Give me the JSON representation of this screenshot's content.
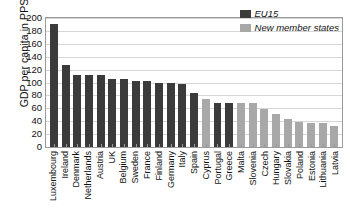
{
  "chart_data": {
    "type": "bar",
    "title": "",
    "subtitle": "",
    "xlabel": "",
    "ylabel": "GDP per capita in PPS",
    "ylim": [
      0,
      200
    ],
    "yticks": [
      0,
      20,
      40,
      60,
      80,
      100,
      120,
      140,
      160,
      180,
      200
    ],
    "grid": true,
    "legend_position": "top-right",
    "categories": [
      "Luxembourg",
      "Ireland",
      "Denmark",
      "Netherlands",
      "Austria",
      "UK",
      "Belgium",
      "Sweden",
      "France",
      "Finland",
      "Germany",
      "Italy",
      "Spain",
      "Cyprus",
      "Portugal",
      "Greece",
      "Malta",
      "Slovenia",
      "Czech",
      "Hungary",
      "Slovakia",
      "Poland",
      "Estonia",
      "Lithuania",
      "Latvia"
    ],
    "values": [
      190,
      127,
      112,
      111,
      111,
      106,
      105,
      102,
      102,
      100,
      99,
      97,
      84,
      75,
      69,
      69,
      68,
      68,
      59,
      51,
      44,
      39,
      38,
      38,
      33
    ],
    "groups": [
      "EU15",
      "EU15",
      "EU15",
      "EU15",
      "EU15",
      "EU15",
      "EU15",
      "EU15",
      "EU15",
      "EU15",
      "EU15",
      "EU15",
      "EU15",
      "New member states",
      "EU15",
      "EU15",
      "New member states",
      "New member states",
      "New member states",
      "New member states",
      "New member states",
      "New member states",
      "New member states",
      "New member states",
      "New member states"
    ],
    "series": [
      {
        "name": "EU15",
        "color": "#3b3b3b",
        "points": [
          {
            "category": "Luxembourg",
            "value": 190
          },
          {
            "category": "Ireland",
            "value": 127
          },
          {
            "category": "Denmark",
            "value": 112
          },
          {
            "category": "Netherlands",
            "value": 111
          },
          {
            "category": "Austria",
            "value": 111
          },
          {
            "category": "UK",
            "value": 106
          },
          {
            "category": "Belgium",
            "value": 105
          },
          {
            "category": "Sweden",
            "value": 102
          },
          {
            "category": "France",
            "value": 102
          },
          {
            "category": "Finland",
            "value": 100
          },
          {
            "category": "Germany",
            "value": 99
          },
          {
            "category": "Italy",
            "value": 97
          },
          {
            "category": "Spain",
            "value": 84
          },
          {
            "category": "Portugal",
            "value": 69
          },
          {
            "category": "Greece",
            "value": 69
          }
        ]
      },
      {
        "name": "New member states",
        "color": "#a8a8a8",
        "points": [
          {
            "category": "Cyprus",
            "value": 75
          },
          {
            "category": "Malta",
            "value": 68
          },
          {
            "category": "Slovenia",
            "value": 68
          },
          {
            "category": "Czech",
            "value": 59
          },
          {
            "category": "Hungary",
            "value": 51
          },
          {
            "category": "Slovakia",
            "value": 44
          },
          {
            "category": "Poland",
            "value": 39
          },
          {
            "category": "Estonia",
            "value": 38
          },
          {
            "category": "Lithuania",
            "value": 38
          },
          {
            "category": "Latvia",
            "value": 33
          }
        ]
      }
    ]
  },
  "legend": {
    "items": [
      {
        "label": "EU15",
        "color": "#3b3b3b"
      },
      {
        "label": "New member states",
        "color": "#a8a8a8"
      }
    ]
  },
  "colors": {
    "eu15": "#3b3b3b",
    "new_member_states": "#a8a8a8",
    "gridline": "#d6d6d6",
    "axis": "#9a9a9a",
    "text": "#111111",
    "background": "#ffffff"
  }
}
